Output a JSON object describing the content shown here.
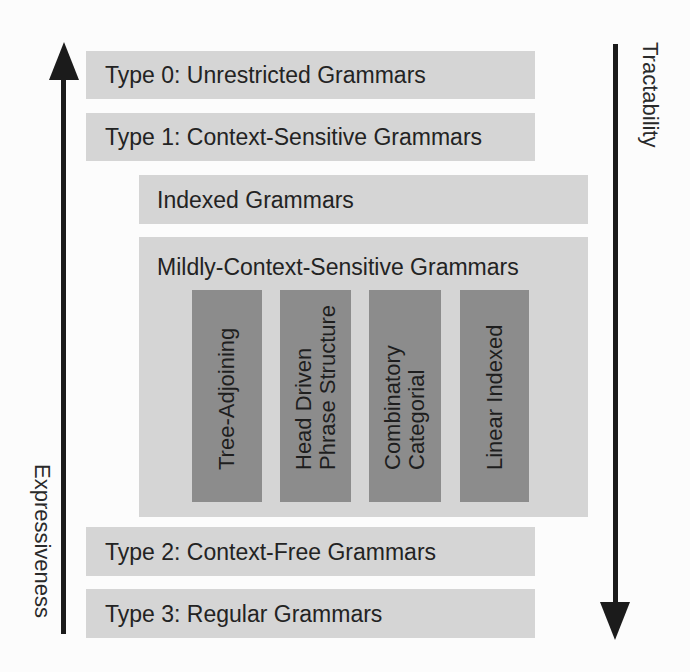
{
  "diagram": {
    "left_axis": {
      "label": "Expressiveness",
      "direction": "up"
    },
    "right_axis": {
      "label": "Tractability",
      "direction": "down"
    },
    "levels": [
      {
        "id": "type0",
        "label": "Type 0: Unrestricted Grammars"
      },
      {
        "id": "type1",
        "label": "Type 1: Context-Sensitive Grammars"
      },
      {
        "id": "indexed",
        "label": "Indexed Grammars"
      },
      {
        "id": "mcsg",
        "label": "Mildly-Context-Sensitive Grammars",
        "subclasses": [
          {
            "label": "Tree-Adjoining"
          },
          {
            "label": "Head Driven Phrase Structure",
            "line1": "Head Driven",
            "line2": "Phrase Structure"
          },
          {
            "label": "Combinatory Categorial",
            "line1": "Combinatory",
            "line2": "Categorial"
          },
          {
            "label": "Linear Indexed"
          }
        ]
      },
      {
        "id": "type2",
        "label": "Type 2: Context-Free Grammars"
      },
      {
        "id": "type3",
        "label": "Type 3: Regular Grammars"
      }
    ],
    "colors": {
      "box": "#d5d5d5",
      "subclass": "#8c8c8c",
      "arrow": "#1b1b1b",
      "text": "#232323"
    }
  }
}
